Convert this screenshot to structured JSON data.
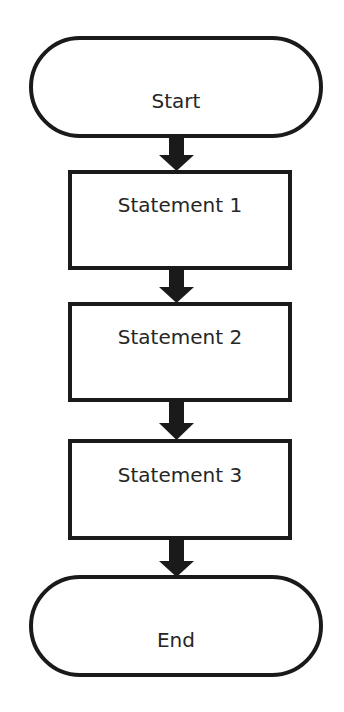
{
  "diagram": {
    "type": "flowchart",
    "nodes": [
      {
        "id": "start",
        "shape": "terminal",
        "label": "Start"
      },
      {
        "id": "s1",
        "shape": "process",
        "label": "Statement 1"
      },
      {
        "id": "s2",
        "shape": "process",
        "label": "Statement 2"
      },
      {
        "id": "s3",
        "shape": "process",
        "label": "Statement 3"
      },
      {
        "id": "end",
        "shape": "terminal",
        "label": "End"
      }
    ],
    "edges": [
      {
        "from": "start",
        "to": "s1"
      },
      {
        "from": "s1",
        "to": "s2"
      },
      {
        "from": "s2",
        "to": "s3"
      },
      {
        "from": "s3",
        "to": "end"
      }
    ],
    "colors": {
      "stroke": "#1a1a1a",
      "fill": "#ffffff",
      "text": "#262626"
    }
  }
}
